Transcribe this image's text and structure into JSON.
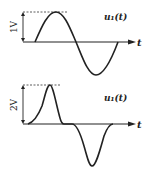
{
  "diagram": {
    "top": {
      "signal_label": "u₁(t)",
      "axis_label": "t",
      "amplitude_label": "1V",
      "waveform": "sine"
    },
    "bottom": {
      "signal_label": "u₁(t)",
      "axis_label": "t",
      "amplitude_label": "2V",
      "waveform": "pulse-pair"
    },
    "colors": {
      "stroke": "#222222",
      "background": "#ffffff"
    }
  }
}
